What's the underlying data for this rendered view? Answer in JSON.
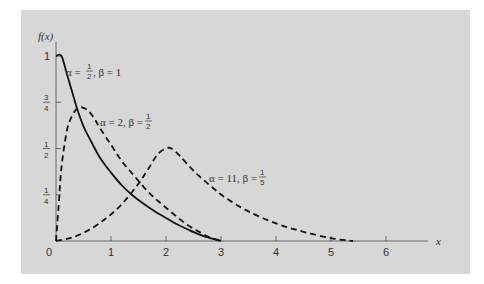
{
  "chart_data": {
    "type": "line",
    "title": "",
    "xlabel": "x",
    "ylabel": "f(x)",
    "xlim": [
      0,
      6.6
    ],
    "ylim": [
      0,
      1.1
    ],
    "grid": false,
    "legend": "inline annotations",
    "x_ticks": [
      "0",
      "1",
      "2",
      "3",
      "4",
      "5",
      "6"
    ],
    "y_ticks": [
      {
        "value": 1,
        "label": "1"
      },
      {
        "value": 0.75,
        "num": "3",
        "den": "4"
      },
      {
        "value": 0.5,
        "num": "1",
        "den": "2"
      },
      {
        "value": 0.25,
        "num": "1",
        "den": "4"
      }
    ],
    "series": [
      {
        "name": "α = 1/2, β = 1",
        "style": "solid",
        "label": {
          "alpha": "α = ",
          "a_num": "1",
          "a_den": "2",
          "beta": ", β = 1"
        },
        "x": [
          0.0,
          0.1,
          0.2,
          0.3,
          0.4,
          0.5,
          0.6,
          0.8,
          1.0,
          1.2,
          1.4,
          1.6,
          1.8,
          2.0,
          2.2,
          2.4,
          2.6,
          2.8,
          3.0
        ],
        "y": [
          1.0,
          1.0,
          0.9,
          0.8,
          0.7,
          0.62,
          0.56,
          0.45,
          0.37,
          0.3,
          0.245,
          0.2,
          0.16,
          0.125,
          0.09,
          0.062,
          0.036,
          0.015,
          0.0
        ]
      },
      {
        "name": "α = 2, β = 1/2",
        "style": "dashed",
        "label": {
          "alpha": "α = 2, β = ",
          "b_num": "1",
          "b_den": "2"
        },
        "x": [
          0.0,
          0.05,
          0.1,
          0.2,
          0.3,
          0.4,
          0.5,
          0.6,
          0.7,
          0.8,
          1.0,
          1.2,
          1.4,
          1.6,
          1.8,
          2.0,
          2.2,
          2.4,
          2.6,
          2.8,
          3.0
        ],
        "y": [
          0.0,
          0.2,
          0.4,
          0.6,
          0.68,
          0.72,
          0.72,
          0.7,
          0.66,
          0.61,
          0.52,
          0.43,
          0.36,
          0.29,
          0.23,
          0.18,
          0.13,
          0.085,
          0.05,
          0.02,
          0.0
        ]
      },
      {
        "name": "α = 11, β = 1/5",
        "style": "dashed",
        "label": {
          "alpha": "α = 11, β = ",
          "b_num": "1",
          "b_den": "5"
        },
        "x": [
          0.0,
          0.3,
          0.6,
          0.9,
          1.2,
          1.5,
          1.7,
          1.85,
          2.0,
          2.1,
          2.25,
          2.5,
          2.8,
          3.1,
          3.5,
          4.0,
          4.5,
          5.0,
          5.4
        ],
        "y": [
          0.0,
          0.02,
          0.06,
          0.12,
          0.2,
          0.31,
          0.4,
          0.47,
          0.5,
          0.5,
          0.46,
          0.38,
          0.3,
          0.23,
          0.16,
          0.095,
          0.05,
          0.015,
          0.0
        ]
      }
    ]
  },
  "axis": {
    "y_label": "f(x)",
    "x_label": "x",
    "origin": "0"
  }
}
